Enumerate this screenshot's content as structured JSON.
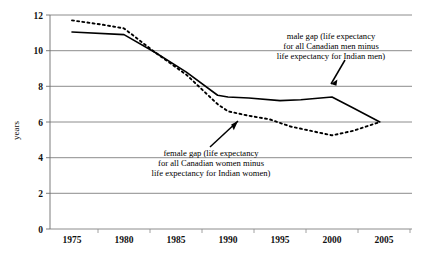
{
  "chart_data": {
    "type": "line",
    "title": "",
    "xlabel": "",
    "ylabel": "years",
    "xlim": [
      1974,
      2006.5
    ],
    "ylim": [
      0,
      12
    ],
    "ytick_values": [
      0,
      2,
      4,
      6,
      8,
      10,
      12
    ],
    "ytick_labels": [
      "0",
      "2",
      "4",
      "6",
      "8",
      "10",
      "12"
    ],
    "xtick_values": [
      1975,
      1980,
      1985,
      1990,
      1995,
      2000,
      2005
    ],
    "xtick_labels": [
      "1975",
      "1980",
      "1985",
      "1990",
      "1995",
      "2000",
      "2005"
    ],
    "grid": "horizontal",
    "legend_position": "none",
    "series": [
      {
        "name": "male gap",
        "style": "solid",
        "color": "#000000",
        "x": [
          1975,
          1980,
          1983,
          1986,
          1989,
          1990,
          1992,
          1995,
          1997,
          2000,
          2002,
          2004.6
        ],
        "values": [
          11.05,
          10.9,
          9.9,
          8.8,
          7.5,
          7.4,
          7.35,
          7.2,
          7.25,
          7.4,
          6.8,
          6.0
        ]
      },
      {
        "name": "female gap",
        "style": "dotted",
        "color": "#000000",
        "x": [
          1975,
          1978,
          1980,
          1983,
          1986,
          1989,
          1990,
          1992,
          1994,
          1996,
          1998,
          2000,
          2002,
          2004.6
        ],
        "values": [
          11.7,
          11.45,
          11.25,
          9.9,
          8.65,
          7.0,
          6.6,
          6.35,
          6.15,
          5.75,
          5.5,
          5.25,
          5.5,
          6.0
        ]
      }
    ],
    "annotations": [
      {
        "id": "male-gap-annotation",
        "lines": [
          "male gap (life expectancy",
          "for all Canadian men minus",
          "life expectancy for Indian men)"
        ],
        "points_to_series": "male gap",
        "points_to_x": 1999,
        "points_to_y": 7.4
      },
      {
        "id": "female-gap-annotation",
        "lines": [
          "female gap (life expectancy",
          "for all Canadian women minus",
          "life expectancy for Indian women)"
        ],
        "points_to_series": "female gap",
        "points_to_x": 1992,
        "points_to_y": 6.35
      }
    ]
  }
}
